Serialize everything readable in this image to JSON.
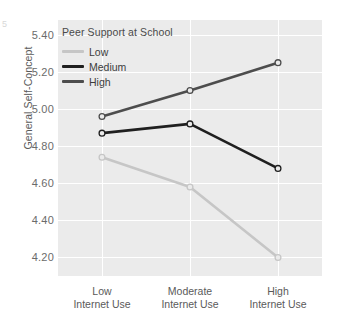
{
  "chart_data": {
    "type": "line",
    "title": "",
    "xlabel": "",
    "ylabel": "General Self-Concept",
    "legend_title": "Peer Support at School",
    "legend_position": "top-left-inside",
    "grid": true,
    "categories": [
      "Low\nInternet Use",
      "Moderate\nInternet Use",
      "High\nInternet Use"
    ],
    "category_lines": [
      [
        "Low",
        "Internet Use"
      ],
      [
        "Moderate",
        "Internet Use"
      ],
      [
        "High",
        "Internet Use"
      ]
    ],
    "ylim": [
      4.1,
      5.48
    ],
    "yticks": [
      5.4,
      5.2,
      5.0,
      4.8,
      4.6,
      4.4,
      4.2
    ],
    "ytick_labels": [
      "5.40",
      "5.20",
      "5.00",
      "4.80",
      "4.60",
      "4.40",
      "4.20"
    ],
    "series": [
      {
        "name": "Low",
        "color": "#c6c6c6",
        "values": [
          4.74,
          4.58,
          4.2
        ]
      },
      {
        "name": "Medium",
        "color": "#1f1f1f",
        "values": [
          4.87,
          4.92,
          4.68
        ]
      },
      {
        "name": "High",
        "color": "#4d4d4d",
        "values": [
          4.96,
          5.1,
          5.25
        ]
      }
    ],
    "marker": "open-circle",
    "panel_background": "#ebebeb",
    "gridline_color": "#ffffff"
  },
  "artifact": {
    "glyph": "5"
  }
}
